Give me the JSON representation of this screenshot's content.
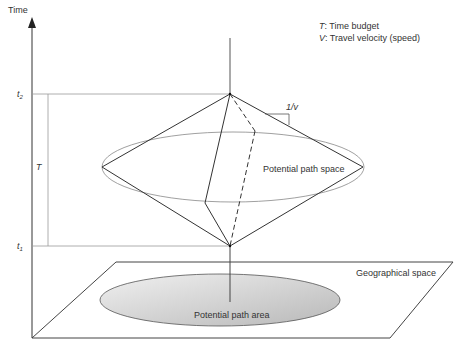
{
  "axis": {
    "time_label": "Time",
    "t2_label": "t",
    "t2_sub": "2",
    "t1_label": "t",
    "t1_sub": "1",
    "T_label": "T"
  },
  "legend": {
    "line1_sym": "T",
    "line1_text": ": Time budget",
    "line2_sym": "V",
    "line2_text": ": Travel velocity (speed)"
  },
  "slope_label": "1/v",
  "labels": {
    "potential_path_space": "Potential path space",
    "geographical_space": "Geographical space",
    "potential_path_area": "Potential path area"
  },
  "colors": {
    "line": "#333333",
    "thin_line": "#888888",
    "area_fill_light": "#f2f2f2",
    "area_fill_dark": "#bdbdbd"
  }
}
